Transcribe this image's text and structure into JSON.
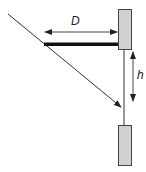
{
  "diagram": {
    "labels": {
      "distance": "D",
      "height": "h"
    },
    "colors": {
      "block_fill": "#d0d0d0",
      "block_stroke": "#444444",
      "line": "#333333",
      "bar": "#111111",
      "background": "#ffffff"
    },
    "elements": {
      "top_block": {
        "x": 118,
        "y": 9,
        "w": 13,
        "h": 40
      },
      "bottom_block": {
        "x": 118,
        "y": 125,
        "w": 13,
        "h": 40
      },
      "horizontal_bar": {
        "x1": 44,
        "x2": 118,
        "y": 44
      },
      "vertical_line": {
        "x": 124,
        "y1": 49,
        "y2": 125
      },
      "diagonal_ray": {
        "x1": 8,
        "y1": 14,
        "x2": 121,
        "y2": 107
      },
      "D_arrow": {
        "x1": 45,
        "x2": 117,
        "y": 32
      },
      "h_arrow": {
        "x": 133,
        "y1": 52,
        "y2": 101
      }
    }
  }
}
